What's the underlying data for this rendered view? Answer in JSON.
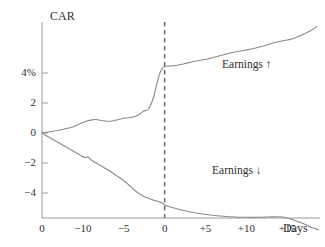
{
  "chart_data": {
    "type": "line",
    "title": "",
    "ylabel": "CAR",
    "xlabel": "Days",
    "grid": false,
    "legend_position": "inline-right",
    "xlim": [
      -15,
      19
    ],
    "ylim": [
      -6.8,
      7.6
    ],
    "y_ticks": [
      {
        "value": 4,
        "label": "4%"
      },
      {
        "value": 2,
        "label": "2"
      },
      {
        "value": 0,
        "label": "0"
      },
      {
        "value": -2,
        "label": "−2"
      },
      {
        "value": -4,
        "label": "−4"
      }
    ],
    "x_ticks": [
      {
        "value": -15,
        "label": "0"
      },
      {
        "value": -10,
        "label": "−10"
      },
      {
        "value": -5,
        "label": "−5"
      },
      {
        "value": 0,
        "label": "0"
      },
      {
        "value": 5,
        "label": "+5"
      },
      {
        "value": 10,
        "label": "+10"
      },
      {
        "value": 15,
        "label": "+15"
      }
    ],
    "annotations": [
      {
        "name": "event-day-marker",
        "type": "vertical-dashed-line",
        "x": 0,
        "label": ""
      }
    ],
    "series": [
      {
        "name": "Earnings ↑",
        "label": "Earnings ↑",
        "color": "#8a8a8a",
        "x": [
          -15,
          -14.4,
          -13.6,
          -12.8,
          -12.0,
          -11.2,
          -10.4,
          -9.6,
          -9.0,
          -8.4,
          -7.6,
          -7.0,
          -6.4,
          -5.6,
          -4.8,
          -4.0,
          -3.2,
          -2.6,
          -2.0,
          -1.4,
          -0.9,
          -0.5,
          -0.2,
          0,
          0.6,
          1.4,
          2.4,
          3.4,
          4.4,
          5.4,
          6.4,
          7.4,
          8.6,
          9.8,
          11.0,
          12.2,
          13.2,
          14.0,
          15.0,
          15.8,
          16.8,
          17.8,
          18.6
        ],
        "y": [
          0.0,
          0.05,
          0.12,
          0.2,
          0.3,
          0.42,
          0.6,
          0.78,
          0.86,
          0.9,
          0.82,
          0.78,
          0.8,
          0.9,
          1.0,
          1.05,
          1.2,
          1.45,
          1.6,
          2.3,
          3.4,
          4.1,
          4.35,
          4.45,
          4.47,
          4.5,
          4.62,
          4.75,
          4.85,
          4.95,
          5.1,
          5.25,
          5.4,
          5.52,
          5.65,
          5.82,
          6.0,
          6.1,
          6.2,
          6.3,
          6.55,
          6.8,
          7.1
        ]
      },
      {
        "name": "Earnings ↓",
        "label": "Earnings ↓",
        "color": "#8a8a8a",
        "x": [
          -15,
          -14.4,
          -13.6,
          -12.8,
          -12.0,
          -11.2,
          -10.4,
          -9.8,
          -9.4,
          -9.0,
          -8.4,
          -7.6,
          -6.8,
          -6.0,
          -5.2,
          -4.4,
          -3.6,
          -2.8,
          -2.0,
          -1.2,
          -0.6,
          -0.2,
          0,
          0.8,
          1.8,
          3.0,
          4.4,
          5.8,
          7.2,
          8.6,
          10.0,
          11.4,
          12.6,
          13.6,
          14.4,
          15.2,
          16.0,
          17.0,
          18.0,
          18.8
        ],
        "y": [
          0.0,
          -0.2,
          -0.45,
          -0.7,
          -0.95,
          -1.2,
          -1.45,
          -1.62,
          -1.6,
          -1.78,
          -2.0,
          -2.25,
          -2.5,
          -2.8,
          -3.1,
          -3.45,
          -3.85,
          -4.15,
          -4.35,
          -4.5,
          -4.6,
          -4.7,
          -4.8,
          -4.95,
          -5.1,
          -5.25,
          -5.38,
          -5.48,
          -5.55,
          -5.6,
          -5.62,
          -5.62,
          -5.6,
          -5.58,
          -5.6,
          -5.7,
          -5.85,
          -6.05,
          -6.3,
          -6.45
        ]
      }
    ]
  },
  "axes": {
    "y_axis_title": "CAR",
    "x_axis_title": "Days"
  },
  "colors": {
    "line": "#8a8a8a",
    "axis": "#9a9a9a",
    "dashed_marker": "#6e6e6e",
    "text": "#2f2f2f",
    "background": "#ffffff"
  }
}
